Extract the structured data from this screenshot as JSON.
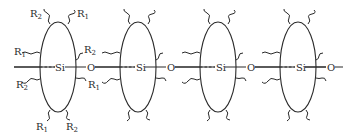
{
  "diagram": {
    "type": "polysiloxane-chain-schematic",
    "units": [
      {
        "cx": 50,
        "si_label": "Si",
        "o_label": "O"
      },
      {
        "cx": 138,
        "si_label": "Si",
        "o_label": "O"
      },
      {
        "cx": 218,
        "si_label": "Si",
        "o_label": "O"
      },
      {
        "cx": 298,
        "si_label": "Si",
        "o_label": "O"
      }
    ],
    "substituent_labels": {
      "top_left": "R2",
      "top_right": "R1",
      "left_upper": "R1",
      "left_lower": "R2",
      "right_upper": "R2",
      "right_lower": "R1",
      "bottom_left": "R1",
      "bottom_right": "R2"
    },
    "colors": {
      "stroke": "#2a2a2a",
      "background": "#ffffff"
    }
  }
}
